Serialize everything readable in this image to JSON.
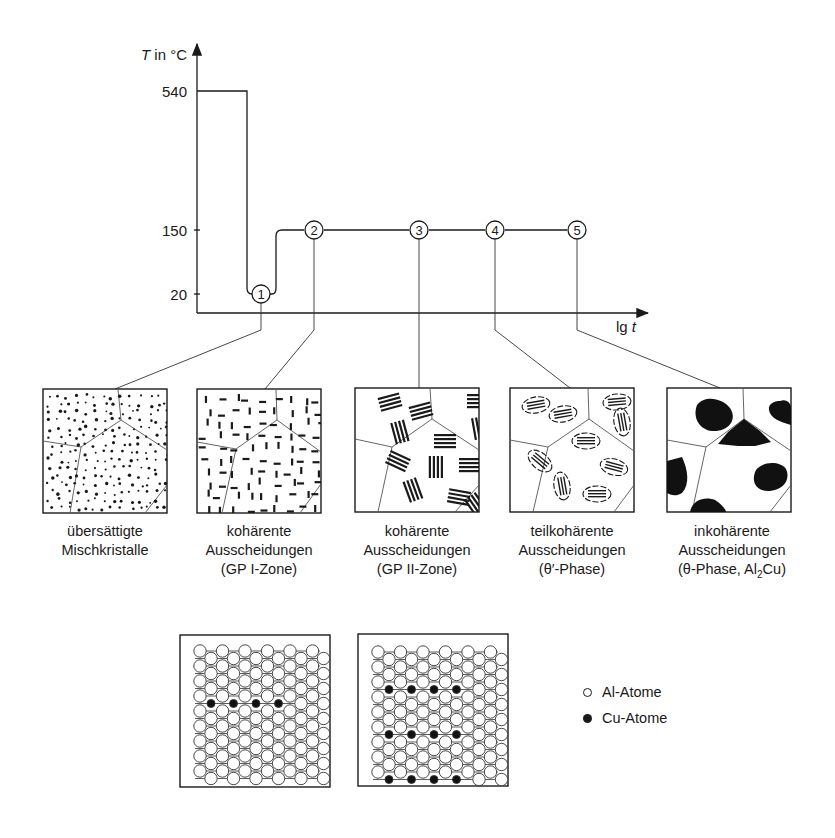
{
  "chart": {
    "y_axis_label_italic": "T",
    "y_axis_label_rest": " in °C",
    "x_axis_label_prefix": "lg ",
    "x_axis_label_italic": "t",
    "y_ticks": [
      "540",
      "150",
      "20"
    ],
    "stages": [
      "1",
      "2",
      "3",
      "4",
      "5"
    ]
  },
  "chart_data": {
    "type": "line",
    "title": "",
    "xlabel": "lg t",
    "ylabel": "T in °C",
    "y_ticks": [
      20,
      150,
      540
    ],
    "series": [
      {
        "name": "Temperaturverlauf",
        "points": [
          {
            "stage": "Lösungsglühen",
            "T": 540
          },
          {
            "stage": "Abschrecken (1)",
            "T": 20
          },
          {
            "stage": "Auslagern (2)",
            "T": 150
          },
          {
            "stage": "Auslagern (3)",
            "T": 150
          },
          {
            "stage": "Auslagern (4)",
            "T": 150
          },
          {
            "stage": "Auslagern (5)",
            "T": 150
          }
        ]
      }
    ],
    "annotations": [
      "1",
      "2",
      "3",
      "4",
      "5"
    ]
  },
  "microstructures": [
    {
      "line1": "übersättigte",
      "line2": "Mischkristalle",
      "line3": ""
    },
    {
      "line1": "kohärente",
      "line2": "Ausscheidungen",
      "line3": "(GP I-Zone)"
    },
    {
      "line1": "kohärente",
      "line2": "Ausscheidungen",
      "line3": "(GP II-Zone)"
    },
    {
      "line1": "teilkohärente",
      "line2": "Ausscheidungen",
      "line3": "(θ′-Phase)"
    },
    {
      "line1": "inkohärente",
      "line2": "Ausscheidungen",
      "line3_pre": "(θ-Phase, Al",
      "line3_sub": "2",
      "line3_post": "Cu)"
    }
  ],
  "legend": {
    "al": "Al-Atome",
    "cu": "Cu-Atome"
  }
}
